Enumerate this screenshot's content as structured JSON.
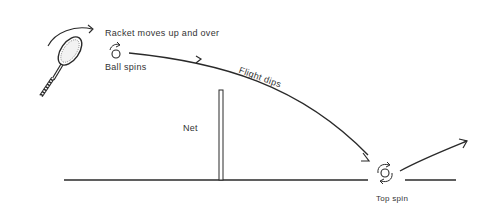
{
  "diagram": {
    "labels": {
      "racket_motion": "Racket moves up and over",
      "ball_spin": "Ball spins",
      "flight": "Flight dips",
      "net": "Net",
      "top_spin": "Top spin"
    },
    "icons": {
      "racket": "tennis-racket-icon",
      "racket_arrow": "curved-arrow-icon",
      "ball": "spinning-ball-icon",
      "bounce_ball": "top-spin-ball-icon"
    },
    "colors": {
      "line": "#2a2a2a",
      "text": "#333333",
      "background": "#ffffff"
    }
  }
}
